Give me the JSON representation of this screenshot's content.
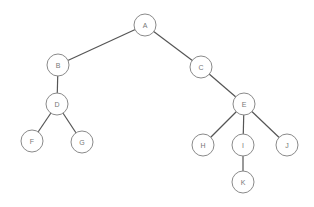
{
  "diagram": {
    "type": "tree",
    "nodes": [
      {
        "id": "A",
        "label": "A"
      },
      {
        "id": "B",
        "label": "B"
      },
      {
        "id": "C",
        "label": "C"
      },
      {
        "id": "D",
        "label": "D"
      },
      {
        "id": "E",
        "label": "E"
      },
      {
        "id": "F",
        "label": "F"
      },
      {
        "id": "G",
        "label": "G"
      },
      {
        "id": "H",
        "label": "H"
      },
      {
        "id": "I",
        "label": "I"
      },
      {
        "id": "J",
        "label": "J"
      },
      {
        "id": "K",
        "label": "K"
      }
    ],
    "edges": [
      {
        "from": "A",
        "to": "B"
      },
      {
        "from": "A",
        "to": "C"
      },
      {
        "from": "B",
        "to": "D"
      },
      {
        "from": "D",
        "to": "F"
      },
      {
        "from": "D",
        "to": "G"
      },
      {
        "from": "C",
        "to": "E"
      },
      {
        "from": "E",
        "to": "H"
      },
      {
        "from": "E",
        "to": "I"
      },
      {
        "from": "E",
        "to": "J"
      },
      {
        "from": "I",
        "to": "K"
      }
    ]
  }
}
